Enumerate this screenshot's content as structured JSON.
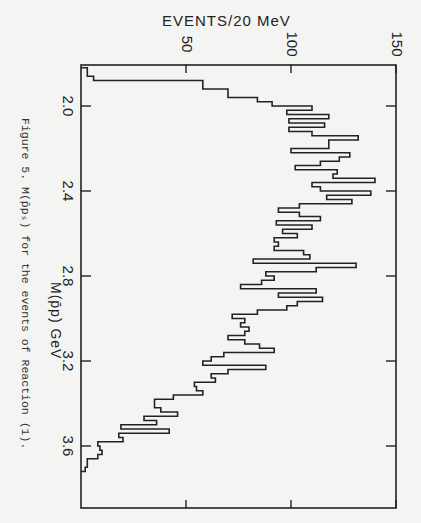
{
  "figure": {
    "caption": "Figure 5.  M(p̄pₛ) for the events of Reaction (1).",
    "orientation": "rotated 90 degrees clockwise"
  },
  "chart_data": {
    "type": "bar",
    "subtype": "histogram",
    "title": "",
    "xlabel": "M(p̄p) GeV",
    "ylabel": "EVENTS/20 MeV",
    "x_ticks": [
      2.0,
      2.4,
      2.8,
      3.2,
      3.6
    ],
    "y_ticks": [
      50,
      100,
      150
    ],
    "xlim": [
      1.81,
      3.89
    ],
    "ylim": [
      0,
      150
    ],
    "bin_width_gev": 0.02,
    "bin_start": 1.82,
    "values": [
      3,
      3,
      6,
      58,
      58,
      70,
      70,
      84,
      91,
      110,
      98,
      118,
      99,
      116,
      99,
      110,
      132,
      118,
      118,
      100,
      128,
      123,
      114,
      102,
      122,
      120,
      140,
      110,
      114,
      138,
      117,
      129,
      104,
      94,
      104,
      114,
      93,
      110,
      96,
      103,
      92,
      94,
      92,
      106,
      109,
      82,
      131,
      112,
      88,
      92,
      86,
      76,
      112,
      94,
      115,
      103,
      98,
      84,
      72,
      78,
      76,
      80,
      78,
      70,
      78,
      85,
      92,
      68,
      62,
      58,
      88,
      70,
      62,
      64,
      54,
      55,
      58,
      44,
      35,
      35,
      38,
      46,
      30,
      36,
      19,
      42,
      18,
      20,
      8,
      9,
      10,
      8,
      3,
      3,
      2
    ],
    "legend": [],
    "grid": false
  },
  "axes": {
    "top": {
      "label": "EVENTS/20 MeV",
      "ticks": [
        "50",
        "100",
        "150"
      ]
    },
    "left": {
      "label": "M(p̄p) GeV",
      "ticks": [
        "2.0",
        "2.4",
        "2.8",
        "3.2",
        "3.6"
      ]
    }
  }
}
